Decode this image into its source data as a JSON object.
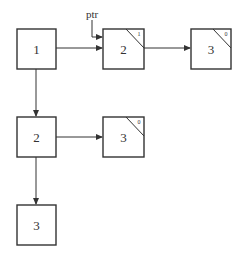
{
  "diagram": {
    "type": "linked-tree",
    "pointer_label": "ptr",
    "nodes": [
      {
        "id": "n1",
        "label": "1",
        "count": null
      },
      {
        "id": "n2a",
        "label": "2",
        "count": "1"
      },
      {
        "id": "n3a",
        "label": "3",
        "count": "0"
      },
      {
        "id": "n2b",
        "label": "2",
        "count": null
      },
      {
        "id": "n3b",
        "label": "3",
        "count": "0"
      },
      {
        "id": "n3c",
        "label": "3",
        "count": null
      }
    ],
    "edges": [
      {
        "from": "n1",
        "to": "n2a"
      },
      {
        "from": "n2a",
        "to": "n3a"
      },
      {
        "from": "n1",
        "to": "n2b"
      },
      {
        "from": "n2b",
        "to": "n3b"
      },
      {
        "from": "n2b",
        "to": "n3c"
      },
      {
        "from": "ptr",
        "to": "n2a"
      }
    ]
  }
}
